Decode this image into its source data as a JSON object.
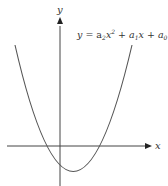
{
  "diagram": {
    "type": "parabola-graph",
    "equation": {
      "y": "y",
      "eq": " = a",
      "sub2": "2",
      "x2": "x",
      "sup2": "2",
      "plus1": " + a",
      "sub1": "1",
      "x1": "x + a",
      "sub0": "0"
    },
    "x_axis_label": "x",
    "y_axis_label": "y",
    "colors": {
      "curve": "#555555",
      "axis": "#333333"
    }
  }
}
